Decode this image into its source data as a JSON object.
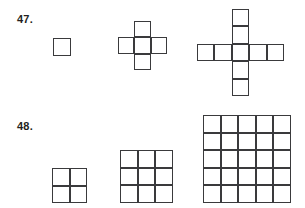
{
  "page": {
    "background_color": "#ffffff",
    "stroke_color": "#3a3a3c",
    "text_color": "#231f20"
  },
  "problems": [
    {
      "id": "problem-47",
      "label": "47.",
      "pattern_type": "cross-polyomino-sequence",
      "figures": [
        {
          "name": "figure-1-single-square",
          "description": "single square",
          "cell_count": 1,
          "arm_length": 0,
          "cells": [
            [
              0,
              0
            ]
          ],
          "origin_x": 53,
          "origin_y": 38,
          "cell_size": 17.5
        },
        {
          "name": "figure-2-small-plus",
          "description": "plus with arms of length 1",
          "cell_count": 5,
          "arm_length": 1,
          "cells": [
            [
              1,
              0
            ],
            [
              0,
              1
            ],
            [
              1,
              1
            ],
            [
              2,
              1
            ],
            [
              1,
              2
            ]
          ],
          "origin_x": 118,
          "origin_y": 21,
          "cell_size": 16.4
        },
        {
          "name": "figure-3-large-plus",
          "description": "plus with arms of length 2",
          "cell_count": 9,
          "arm_length": 2,
          "cells": [
            [
              2,
              0
            ],
            [
              2,
              1
            ],
            [
              0,
              2
            ],
            [
              1,
              2
            ],
            [
              2,
              2
            ],
            [
              3,
              2
            ],
            [
              4,
              2
            ],
            [
              2,
              3
            ],
            [
              2,
              4
            ]
          ],
          "origin_x": 197,
          "origin_y": 9,
          "cell_size": 17.4
        }
      ]
    },
    {
      "id": "problem-48",
      "label": "48.",
      "pattern_type": "square-grid-sequence",
      "figures": [
        {
          "name": "figure-1-grid-2x2",
          "description": "2 by 2 square grid",
          "rows": 2,
          "cols": 2,
          "cell_count": 4,
          "origin_x": 52,
          "origin_y": 64,
          "cell_size": 17.6
        },
        {
          "name": "figure-2-grid-3x3",
          "description": "3 by 3 square grid",
          "rows": 3,
          "cols": 3,
          "cell_count": 9,
          "origin_x": 120,
          "origin_y": 46,
          "cell_size": 17.6
        },
        {
          "name": "figure-3-grid-5x5",
          "description": "5 by 5 square grid",
          "rows": 5,
          "cols": 5,
          "cell_count": 25,
          "origin_x": 203,
          "origin_y": 11,
          "cell_size": 17.6
        }
      ]
    }
  ]
}
